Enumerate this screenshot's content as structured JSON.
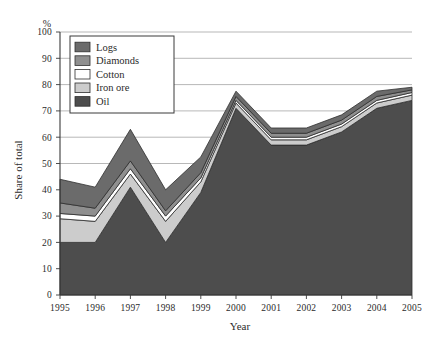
{
  "chart_data": {
    "type": "area",
    "stacked": true,
    "title": "",
    "subtitle": "",
    "xlabel": "Year",
    "ylabel": "Share of total",
    "unit_label": "%",
    "categories": [
      "1995",
      "1996",
      "1997",
      "1998",
      "1999",
      "2000",
      "2001",
      "2002",
      "2003",
      "2004",
      "2005"
    ],
    "x": [
      1995,
      1996,
      1997,
      1998,
      1999,
      2000,
      2001,
      2002,
      2003,
      2004,
      2005
    ],
    "xlim": [
      1995,
      2005
    ],
    "ylim": [
      0,
      100
    ],
    "yticks": [
      0,
      10,
      20,
      30,
      40,
      50,
      60,
      70,
      80,
      90,
      100
    ],
    "ytick_labels": [
      "0",
      "10",
      "20",
      "30",
      "40",
      "50",
      "60",
      "70",
      "80",
      "90",
      "100"
    ],
    "grid": true,
    "grid_axis": "y",
    "legend_position": "top-left inside plot",
    "stack_order_bottom_to_top": [
      "Oil",
      "Iron ore",
      "Cotton",
      "Diamonds",
      "Logs"
    ],
    "series": [
      {
        "name": "Oil",
        "color": "#4d4d4d",
        "values": [
          20,
          20,
          41,
          20,
          39,
          71,
          57,
          57,
          62,
          71,
          74
        ]
      },
      {
        "name": "Iron ore",
        "color": "#cccccc",
        "values": [
          9,
          8,
          5,
          8,
          4,
          2,
          2,
          2,
          2,
          2,
          2
        ]
      },
      {
        "name": "Cotton",
        "color": "#ffffff",
        "values": [
          2,
          2,
          2,
          2,
          1.5,
          1,
          1,
          1,
          1,
          1,
          1
        ]
      },
      {
        "name": "Diamonds",
        "color": "#8f8f8f",
        "values": [
          4,
          3,
          3,
          2,
          2,
          1.5,
          1.5,
          1.5,
          1.5,
          1.5,
          1
        ]
      },
      {
        "name": "Logs",
        "color": "#6b6b6b",
        "values": [
          9,
          8,
          12,
          8,
          6,
          2,
          2,
          2,
          2,
          2,
          1
        ]
      }
    ],
    "totals": [
      44,
      41,
      63,
      40,
      52,
      77,
      63,
      62,
      68,
      77,
      79
    ]
  },
  "legend": {
    "items": [
      {
        "label": "Logs",
        "swatch": "#6b6b6b"
      },
      {
        "label": "Diamonds",
        "swatch": "#8f8f8f"
      },
      {
        "label": "Cotton",
        "swatch": "#ffffff"
      },
      {
        "label": "Iron ore",
        "swatch": "#cccccc"
      },
      {
        "label": "Oil",
        "swatch": "#4d4d4d"
      }
    ]
  },
  "colors": {
    "axis": "#3a3a3a",
    "grid": "#9a9a9a",
    "text": "#2b2b2b",
    "background": "#ffffff",
    "legend_border": "#3a3a3a"
  }
}
